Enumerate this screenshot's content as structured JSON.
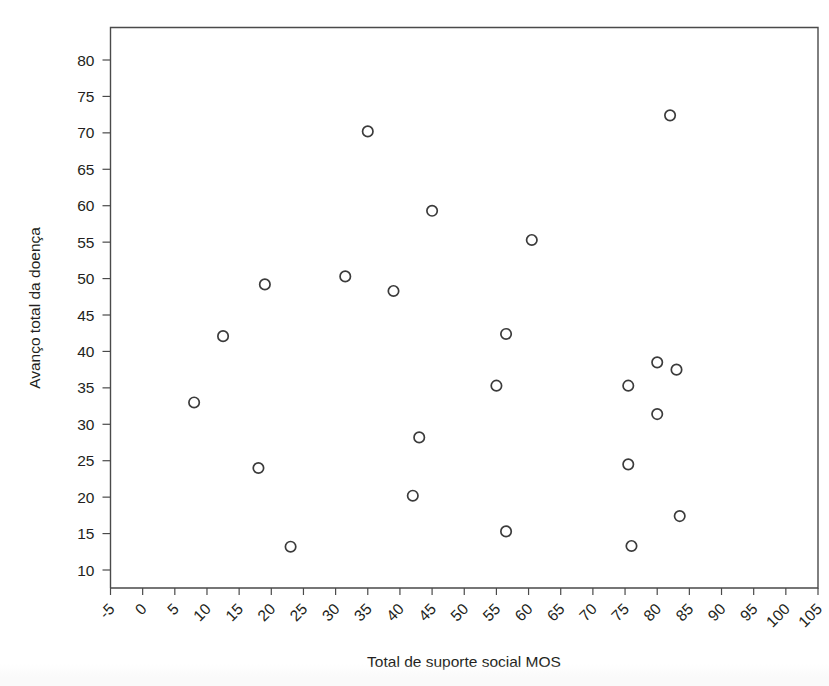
{
  "chart_data": {
    "type": "scatter",
    "title": "",
    "xlabel": "Total de suporte social MOS",
    "ylabel": "Avanço total da doença",
    "xlim": [
      -5,
      105
    ],
    "ylim": [
      7,
      83.5
    ],
    "grid": false,
    "legend": null,
    "x_ticks": [
      -5,
      0,
      5,
      10,
      15,
      20,
      25,
      30,
      35,
      40,
      45,
      50,
      55,
      60,
      65,
      70,
      75,
      80,
      85,
      90,
      95,
      100,
      105
    ],
    "x_tick_labels": [
      "-5",
      "0",
      "5",
      "10",
      "15",
      "20",
      "25",
      "30",
      "35",
      "40",
      "45",
      "50",
      "55",
      "60",
      "65",
      "70",
      "75",
      "80",
      "85",
      "90",
      "95",
      "100",
      "105"
    ],
    "y_ticks": [
      10,
      15,
      20,
      25,
      30,
      35,
      40,
      45,
      50,
      55,
      60,
      65,
      70,
      75,
      80
    ],
    "y_tick_labels": [
      "10",
      "15",
      "20",
      "25",
      "30",
      "35",
      "40",
      "45",
      "50",
      "55",
      "60",
      "65",
      "70",
      "75",
      "80"
    ],
    "x_tick_label_rotation": -45,
    "marker": "open-circle",
    "marker_color": "#3b3b3b",
    "points": [
      {
        "x": 8.0,
        "y": 33.0
      },
      {
        "x": 12.5,
        "y": 42.1
      },
      {
        "x": 18.0,
        "y": 24.0
      },
      {
        "x": 19.0,
        "y": 49.2
      },
      {
        "x": 23.0,
        "y": 13.2
      },
      {
        "x": 31.5,
        "y": 50.3
      },
      {
        "x": 35.0,
        "y": 70.2
      },
      {
        "x": 39.0,
        "y": 48.3
      },
      {
        "x": 42.0,
        "y": 20.2
      },
      {
        "x": 43.0,
        "y": 28.2
      },
      {
        "x": 45.0,
        "y": 59.3
      },
      {
        "x": 55.0,
        "y": 35.3
      },
      {
        "x": 56.5,
        "y": 42.4
      },
      {
        "x": 56.5,
        "y": 15.3
      },
      {
        "x": 60.5,
        "y": 55.3
      },
      {
        "x": 75.5,
        "y": 35.3
      },
      {
        "x": 75.5,
        "y": 24.5
      },
      {
        "x": 76.0,
        "y": 13.3
      },
      {
        "x": 80.0,
        "y": 38.5
      },
      {
        "x": 80.0,
        "y": 31.4
      },
      {
        "x": 82.0,
        "y": 72.4
      },
      {
        "x": 83.0,
        "y": 37.5
      },
      {
        "x": 83.5,
        "y": 17.4
      }
    ]
  },
  "figure": {
    "background_color": "#ffffff",
    "axis_color": "#4a4a4a"
  }
}
